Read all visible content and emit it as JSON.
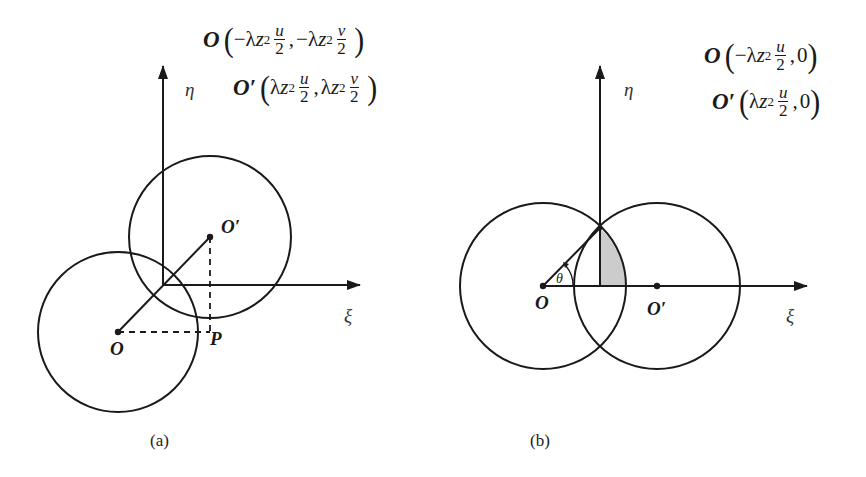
{
  "figure": {
    "panel_a": {
      "caption": "(a)",
      "axis_x_label": "ξ",
      "axis_y_label": "η",
      "points": {
        "O": "O",
        "O_prime": "O′",
        "P": "P"
      },
      "formula_O": {
        "point": "O",
        "open": "(",
        "minus1": "−λ",
        "z": "z",
        "sub": "2",
        "num1": "u",
        "den1": "2",
        "comma": ",",
        "minus2": "−λ",
        "num2": "v",
        "den2": "2",
        "close": ")"
      },
      "formula_O_prime": {
        "point": "O′",
        "open": "(",
        "lam1": "λ",
        "z": "z",
        "sub": "2",
        "num1": "u",
        "den1": "2",
        "comma": ",",
        "lam2": "λ",
        "num2": "v",
        "den2": "2",
        "close": ")"
      }
    },
    "panel_b": {
      "caption": "(b)",
      "axis_x_label": "ξ",
      "axis_y_label": "η",
      "angle_label": "θ",
      "points": {
        "O": "O",
        "O_prime": "O′"
      },
      "formula_O": {
        "point": "O",
        "open": "(",
        "minus1": "−λ",
        "z": "z",
        "sub": "2",
        "num1": "u",
        "den1": "2",
        "comma": ",",
        "zero": "0",
        "close": ")"
      },
      "formula_O_prime": {
        "point": "O′",
        "open": "(",
        "lam1": "λ",
        "z": "z",
        "sub": "2",
        "num1": "u",
        "den1": "2",
        "comma": ",",
        "zero": "0",
        "close": ")"
      }
    },
    "colors": {
      "stroke": "#1a1a1a",
      "shade": "#cccccc",
      "background": "#ffffff"
    }
  }
}
